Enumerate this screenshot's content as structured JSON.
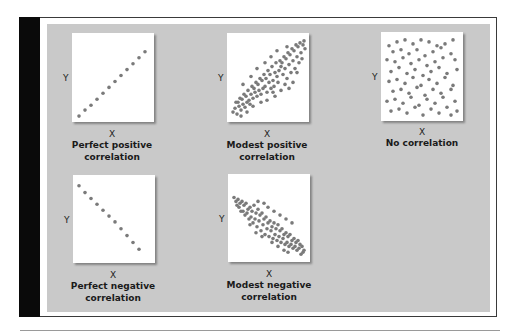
{
  "figure": {
    "panel_bg_color": "#c9c9c9",
    "dot_color": "#7a7a7a",
    "panels": [
      {
        "id": "perfect-positive",
        "y_label": "Y",
        "x_label": "X",
        "caption_line1": "Perfect positive",
        "caption_line2": "correlation"
      },
      {
        "id": "modest-positive",
        "y_label": "Y",
        "x_label": "X",
        "caption_line1": "Modest positive",
        "caption_line2": "correlation"
      },
      {
        "id": "no-correlation",
        "y_label": "Y",
        "x_label": "X",
        "caption_line1": "No correlation",
        "caption_line2": ""
      },
      {
        "id": "perfect-negative",
        "y_label": "Y",
        "x_label": "X",
        "caption_line1": "Perfect negative",
        "caption_line2": "correlation"
      },
      {
        "id": "modest-negative",
        "y_label": "Y",
        "x_label": "X",
        "caption_line1": "Modest negative",
        "caption_line2": "correlation"
      }
    ]
  },
  "chart_data": [
    {
      "type": "scatter",
      "title": "Perfect positive correlation",
      "xlabel": "X",
      "ylabel": "Y",
      "points": [
        [
          7,
          84
        ],
        [
          13,
          78
        ],
        [
          19,
          73
        ],
        [
          25,
          67
        ],
        [
          31,
          61
        ],
        [
          37,
          55
        ],
        [
          43,
          49
        ],
        [
          49,
          43
        ],
        [
          55,
          37
        ],
        [
          61,
          31
        ],
        [
          67,
          25
        ],
        [
          73,
          19
        ]
      ]
    },
    {
      "type": "scatter",
      "title": "Modest positive correlation",
      "xlabel": "X",
      "ylabel": "Y",
      "points": [
        [
          6,
          80
        ],
        [
          8,
          76
        ],
        [
          10,
          82
        ],
        [
          12,
          74
        ],
        [
          11,
          70
        ],
        [
          14,
          78
        ],
        [
          16,
          72
        ],
        [
          15,
          67
        ],
        [
          18,
          75
        ],
        [
          20,
          70
        ],
        [
          19,
          64
        ],
        [
          22,
          68
        ],
        [
          24,
          62
        ],
        [
          23,
          72
        ],
        [
          26,
          66
        ],
        [
          28,
          60
        ],
        [
          27,
          56
        ],
        [
          30,
          64
        ],
        [
          32,
          58
        ],
        [
          31,
          52
        ],
        [
          34,
          62
        ],
        [
          36,
          56
        ],
        [
          35,
          48
        ],
        [
          38,
          54
        ],
        [
          40,
          60
        ],
        [
          39,
          46
        ],
        [
          42,
          50
        ],
        [
          44,
          56
        ],
        [
          43,
          42
        ],
        [
          46,
          48
        ],
        [
          48,
          40
        ],
        [
          47,
          54
        ],
        [
          50,
          44
        ],
        [
          52,
          38
        ],
        [
          51,
          50
        ],
        [
          54,
          34
        ],
        [
          56,
          42
        ],
        [
          55,
          30
        ],
        [
          58,
          36
        ],
        [
          60,
          46
        ],
        [
          59,
          26
        ],
        [
          62,
          32
        ],
        [
          64,
          40
        ],
        [
          63,
          22
        ],
        [
          66,
          28
        ],
        [
          68,
          36
        ],
        [
          67,
          18
        ],
        [
          70,
          24
        ],
        [
          72,
          30
        ],
        [
          71,
          14
        ],
        [
          74,
          20
        ],
        [
          76,
          12
        ],
        [
          75,
          26
        ],
        [
          78,
          16
        ],
        [
          77,
          8
        ],
        [
          73,
          10
        ],
        [
          69,
          12
        ],
        [
          65,
          16
        ],
        [
          61,
          20
        ],
        [
          57,
          24
        ],
        [
          53,
          28
        ],
        [
          49,
          30
        ],
        [
          45,
          34
        ],
        [
          41,
          38
        ],
        [
          37,
          42
        ],
        [
          33,
          46
        ],
        [
          29,
          50
        ],
        [
          25,
          54
        ],
        [
          21,
          58
        ],
        [
          17,
          62
        ],
        [
          13,
          66
        ],
        [
          9,
          70
        ],
        [
          60,
          14
        ],
        [
          50,
          18
        ],
        [
          44,
          24
        ],
        [
          38,
          30
        ],
        [
          30,
          36
        ],
        [
          24,
          44
        ],
        [
          16,
          52
        ],
        [
          66,
          50
        ],
        [
          70,
          40
        ],
        [
          58,
          52
        ],
        [
          46,
          60
        ],
        [
          40,
          68
        ],
        [
          34,
          70
        ],
        [
          26,
          74
        ],
        [
          20,
          80
        ],
        [
          14,
          84
        ],
        [
          62,
          56
        ],
        [
          54,
          58
        ],
        [
          48,
          64
        ]
      ]
    },
    {
      "type": "scatter",
      "title": "No correlation",
      "xlabel": "X",
      "ylabel": "Y",
      "points": [
        [
          8,
          14
        ],
        [
          16,
          10
        ],
        [
          24,
          8
        ],
        [
          32,
          12
        ],
        [
          40,
          8
        ],
        [
          48,
          10
        ],
        [
          56,
          14
        ],
        [
          64,
          12
        ],
        [
          72,
          8
        ],
        [
          12,
          20
        ],
        [
          20,
          18
        ],
        [
          28,
          22
        ],
        [
          36,
          18
        ],
        [
          44,
          24
        ],
        [
          52,
          20
        ],
        [
          60,
          16
        ],
        [
          70,
          22
        ],
        [
          6,
          28
        ],
        [
          14,
          30
        ],
        [
          22,
          26
        ],
        [
          30,
          32
        ],
        [
          38,
          28
        ],
        [
          46,
          34
        ],
        [
          54,
          30
        ],
        [
          62,
          26
        ],
        [
          74,
          28
        ],
        [
          10,
          40
        ],
        [
          18,
          36
        ],
        [
          26,
          42
        ],
        [
          34,
          38
        ],
        [
          42,
          44
        ],
        [
          50,
          40
        ],
        [
          58,
          36
        ],
        [
          66,
          42
        ],
        [
          76,
          38
        ],
        [
          8,
          50
        ],
        [
          16,
          48
        ],
        [
          24,
          52
        ],
        [
          32,
          46
        ],
        [
          40,
          54
        ],
        [
          48,
          48
        ],
        [
          56,
          52
        ],
        [
          64,
          46
        ],
        [
          72,
          54
        ],
        [
          12,
          60
        ],
        [
          20,
          58
        ],
        [
          28,
          62
        ],
        [
          36,
          56
        ],
        [
          44,
          64
        ],
        [
          52,
          58
        ],
        [
          60,
          62
        ],
        [
          70,
          58
        ],
        [
          6,
          70
        ],
        [
          14,
          68
        ],
        [
          22,
          72
        ],
        [
          30,
          66
        ],
        [
          38,
          74
        ],
        [
          46,
          68
        ],
        [
          54,
          72
        ],
        [
          62,
          66
        ],
        [
          74,
          70
        ],
        [
          10,
          80
        ],
        [
          18,
          78
        ],
        [
          26,
          82
        ],
        [
          34,
          76
        ],
        [
          42,
          84
        ],
        [
          50,
          78
        ],
        [
          58,
          82
        ],
        [
          66,
          76
        ],
        [
          70,
          84
        ],
        [
          76,
          80
        ]
      ]
    },
    {
      "type": "scatter",
      "title": "Perfect negative correlation",
      "xlabel": "X",
      "ylabel": "Y",
      "points": [
        [
          6,
          11
        ],
        [
          12,
          18
        ],
        [
          18,
          24
        ],
        [
          24,
          30
        ],
        [
          30,
          36
        ],
        [
          36,
          42
        ],
        [
          42,
          48
        ],
        [
          48,
          55
        ],
        [
          54,
          62
        ],
        [
          60,
          69
        ],
        [
          66,
          76
        ]
      ]
    },
    {
      "type": "scatter",
      "title": "Modest negative correlation",
      "xlabel": "X",
      "ylabel": "Y",
      "points": [
        [
          6,
          24
        ],
        [
          8,
          28
        ],
        [
          10,
          26
        ],
        [
          12,
          30
        ],
        [
          11,
          34
        ],
        [
          14,
          28
        ],
        [
          16,
          32
        ],
        [
          15,
          38
        ],
        [
          18,
          30
        ],
        [
          20,
          36
        ],
        [
          19,
          40
        ],
        [
          22,
          34
        ],
        [
          24,
          38
        ],
        [
          23,
          44
        ],
        [
          26,
          32
        ],
        [
          28,
          40
        ],
        [
          27,
          46
        ],
        [
          30,
          36
        ],
        [
          32,
          42
        ],
        [
          31,
          48
        ],
        [
          34,
          40
        ],
        [
          36,
          46
        ],
        [
          35,
          52
        ],
        [
          38,
          44
        ],
        [
          40,
          50
        ],
        [
          39,
          56
        ],
        [
          42,
          48
        ],
        [
          44,
          54
        ],
        [
          43,
          58
        ],
        [
          46,
          50
        ],
        [
          48,
          56
        ],
        [
          47,
          62
        ],
        [
          50,
          52
        ],
        [
          52,
          58
        ],
        [
          51,
          64
        ],
        [
          54,
          56
        ],
        [
          56,
          62
        ],
        [
          55,
          66
        ],
        [
          58,
          60
        ],
        [
          60,
          64
        ],
        [
          59,
          70
        ],
        [
          62,
          62
        ],
        [
          64,
          68
        ],
        [
          63,
          72
        ],
        [
          66,
          66
        ],
        [
          68,
          70
        ],
        [
          67,
          74
        ],
        [
          70,
          68
        ],
        [
          72,
          72
        ],
        [
          71,
          76
        ],
        [
          74,
          74
        ],
        [
          76,
          78
        ],
        [
          75,
          80
        ],
        [
          73,
          82
        ],
        [
          69,
          78
        ],
        [
          65,
          76
        ],
        [
          61,
          74
        ],
        [
          57,
          72
        ],
        [
          53,
          70
        ],
        [
          49,
          68
        ],
        [
          45,
          66
        ],
        [
          41,
          64
        ],
        [
          37,
          62
        ],
        [
          33,
          58
        ],
        [
          29,
          54
        ],
        [
          25,
          50
        ],
        [
          21,
          46
        ],
        [
          17,
          42
        ],
        [
          13,
          38
        ],
        [
          9,
          32
        ],
        [
          30,
          28
        ],
        [
          36,
          30
        ],
        [
          40,
          34
        ],
        [
          46,
          38
        ],
        [
          52,
          42
        ],
        [
          58,
          46
        ],
        [
          64,
          50
        ],
        [
          22,
          52
        ],
        [
          28,
          60
        ],
        [
          34,
          64
        ],
        [
          44,
          70
        ],
        [
          50,
          74
        ],
        [
          56,
          78
        ],
        [
          60,
          80
        ]
      ]
    }
  ]
}
